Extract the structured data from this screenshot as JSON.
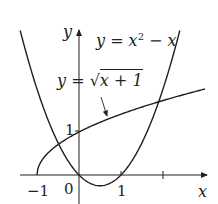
{
  "chart_data": {
    "type": "line",
    "title": "",
    "xlabel": "x",
    "ylabel": "y",
    "x_ticks": [
      "-1",
      "0",
      "1",
      ""
    ],
    "y_ticks": [
      "1"
    ],
    "xlim": [
      -1.5,
      3.0
    ],
    "ylim": [
      -0.6,
      3.4
    ],
    "grid": false,
    "series": [
      {
        "name": "y = x^2 - x",
        "function": "x^2 - x",
        "domain": [
          -1.4,
          2.4
        ]
      },
      {
        "name": "y = sqrt(x+1)",
        "function": "sqrt(x+1)",
        "domain": [
          -1,
          3.0
        ]
      }
    ],
    "intersections": [
      [
        -0.47,
        0.73
      ],
      [
        1.84,
        1.69
      ]
    ],
    "annotations": [
      {
        "text": "y = x² − x",
        "target": "parabola"
      },
      {
        "text": "y = √(x + 1)",
        "target": "square-root curve",
        "arrow": true
      }
    ]
  },
  "labels": {
    "y_axis": "y",
    "x_axis": "x",
    "x_tick_neg1": "−1",
    "x_tick_0": "0",
    "x_tick_1": "1",
    "y_tick_1": "1",
    "parabola_eq_prefix": "y = x",
    "parabola_eq_exp": "2",
    "parabola_eq_suffix": " − x",
    "sqrt_eq_prefix": "y = ",
    "sqrt_eq_radicand": "x + 1"
  }
}
